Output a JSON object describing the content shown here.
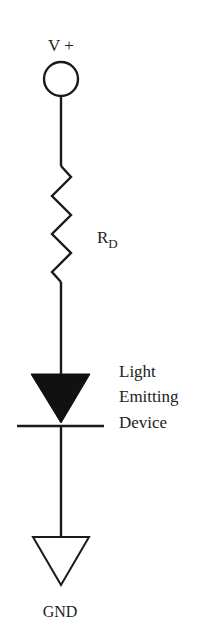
{
  "diagram": {
    "type": "circuit-schematic",
    "colors": {
      "stroke": "#1a1a1a",
      "text": "#222222",
      "background": "#ffffff"
    },
    "supply": {
      "label": "V +",
      "symbol": "circle-terminal"
    },
    "resistor": {
      "label_main": "R",
      "label_sub": "D",
      "symbol": "zigzag-resistor"
    },
    "led": {
      "symbol": "diode-triangle",
      "label_lines": [
        "Light",
        "Emitting",
        "Device"
      ]
    },
    "ground": {
      "label": "GND",
      "symbol": "ground-triangle"
    }
  }
}
